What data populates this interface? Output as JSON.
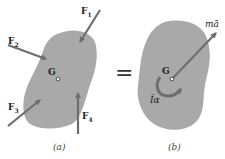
{
  "figure": {
    "left_panel": {
      "caption": "(a)",
      "center_label": "G",
      "forces": [
        {
          "id": "F1",
          "label": "F",
          "sub": "1"
        },
        {
          "id": "F2",
          "label": "F",
          "sub": "2"
        },
        {
          "id": "F3",
          "label": "F",
          "sub": "3"
        },
        {
          "id": "F4",
          "label": "F",
          "sub": "4"
        }
      ]
    },
    "equals_sign": "=",
    "right_panel": {
      "caption": "(b)",
      "center_label": "G",
      "vector_label": "mā",
      "moment_label": "Īα"
    },
    "colors": {
      "body_fill": "#a9a9a9",
      "arrow": "#6e6e6e",
      "background": "#ffffff"
    }
  }
}
